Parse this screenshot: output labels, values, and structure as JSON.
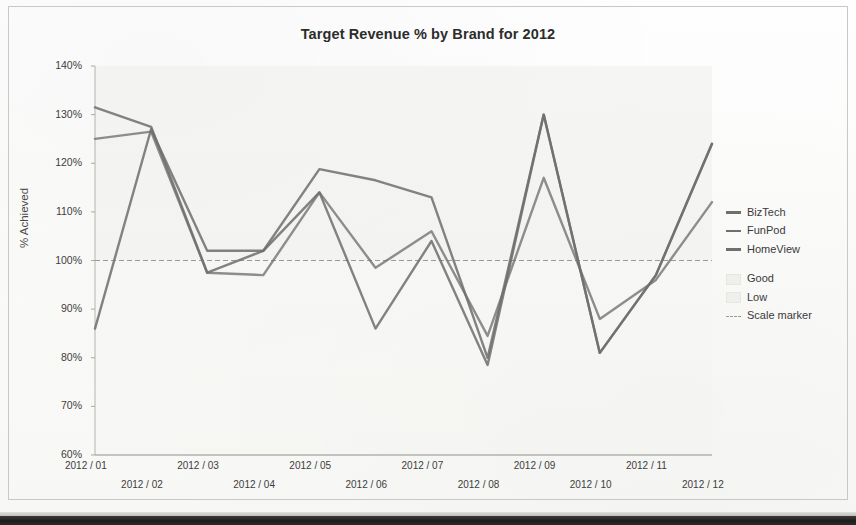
{
  "chart_data": {
    "type": "line",
    "title": "Target Revenue % by Brand for 2012",
    "xlabel": "",
    "ylabel": "% Achieved",
    "ylim": [
      60,
      140
    ],
    "ytick_step": 10,
    "ytick_labels": [
      "140%",
      "130%",
      "120%",
      "110%",
      "100%",
      "90%",
      "80%",
      "70%",
      "60%"
    ],
    "ytick_values": [
      140,
      130,
      120,
      110,
      100,
      90,
      80,
      70,
      60
    ],
    "grid": false,
    "legend_position": "right",
    "categories": [
      "2012 / 01",
      "2012 / 02",
      "2012 / 03",
      "2012 / 04",
      "2012 / 05",
      "2012 / 06",
      "2012 / 07",
      "2012 / 08",
      "2012 / 09",
      "2012 / 10",
      "2012 / 11",
      "2012 / 12"
    ],
    "series": [
      {
        "name": "BizTech",
        "color": "#6f6f6f",
        "values": [
          131.5,
          127.5,
          97.5,
          102.0,
          118.8,
          116.5,
          113.0,
          80.0,
          130.0,
          81.0,
          97.0,
          124.0
        ]
      },
      {
        "name": "FunPod",
        "color": "#6f6f6f",
        "values": [
          125.0,
          126.5,
          97.5,
          97.0,
          114.0,
          98.5,
          106.0,
          84.5,
          117.0,
          88.0,
          96.0,
          112.0
        ]
      },
      {
        "name": "HomeView",
        "color": "#6f6f6f",
        "values": [
          86.0,
          127.0,
          102.0,
          102.0,
          114.0,
          86.0,
          104.0,
          78.5,
          130.0,
          81.0,
          97.0,
          124.0
        ]
      }
    ],
    "bands": [
      {
        "name": "Good",
        "color": "#efefec"
      },
      {
        "name": "Low",
        "color": "#f5f5f2"
      }
    ],
    "reference_lines": [
      {
        "name": "Scale marker",
        "value": 100,
        "style": "dashed",
        "color": "#9a9a96"
      }
    ],
    "annotations": []
  },
  "legend": {
    "items": [
      {
        "label": "BizTech",
        "marker": "line"
      },
      {
        "label": "FunPod",
        "marker": "line"
      },
      {
        "label": "HomeView",
        "marker": "line"
      },
      {
        "label": "Good",
        "marker": "band"
      },
      {
        "label": "Low",
        "marker": "band"
      },
      {
        "label": "Scale marker",
        "marker": "dash"
      }
    ]
  }
}
